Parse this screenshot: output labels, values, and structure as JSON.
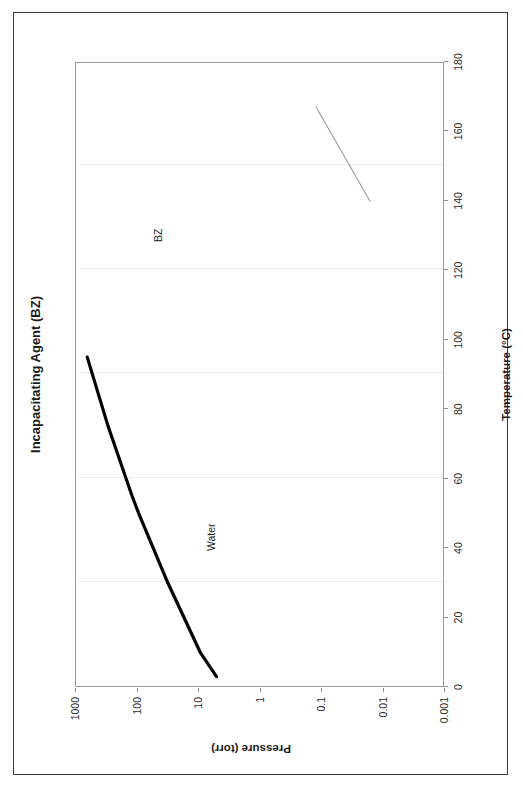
{
  "document": {
    "border_color": "#3a3a3a",
    "background": "#ffffff",
    "orientation": "landscape page scanned in portrait (chart rotated 90 degrees)"
  },
  "chart_data": {
    "type": "line",
    "title": "Incapacitating Agent (BZ)",
    "xlabel": "Temperature (°C)",
    "ylabel": "Pressure (torr)",
    "xlim": [
      0,
      180
    ],
    "xticks": [
      "0",
      "20",
      "40",
      "60",
      "80",
      "100",
      "120",
      "140",
      "160",
      "180"
    ],
    "xtick_values": [
      0,
      20,
      40,
      60,
      80,
      100,
      120,
      140,
      160,
      180
    ],
    "yscale": "log",
    "ylim": [
      0.001,
      1000
    ],
    "yticks": [
      "1000",
      "100",
      "10",
      "1",
      "0.1",
      "0.01",
      "0.001"
    ],
    "ytick_values": [
      1000,
      100,
      10,
      1,
      0.1,
      0.01,
      0.001
    ],
    "grid": "vertical dotted gridlines at each decade of pressure",
    "legend": "inline series labels",
    "series": [
      {
        "name": "Water",
        "label": "Water",
        "color": "#000000",
        "linewidth": 3.2,
        "points": [
          {
            "x": 3,
            "y": 5
          },
          {
            "x": 10,
            "y": 9.2
          },
          {
            "x": 30,
            "y": 31
          },
          {
            "x": 50,
            "y": 92
          },
          {
            "x": 55,
            "y": 118
          },
          {
            "x": 75,
            "y": 289
          },
          {
            "x": 95,
            "y": 634
          }
        ]
      },
      {
        "name": "BZ",
        "label": "BZ",
        "color": "#9a9a9a",
        "linewidth": 1.1,
        "points": [
          {
            "x": 140,
            "y": 0.016
          },
          {
            "x": 167,
            "y": 0.12
          }
        ]
      }
    ],
    "annotations": [
      {
        "text": "Water",
        "x": 68,
        "y": 60
      },
      {
        "text": "BZ",
        "x": 150,
        "y": 0.055
      }
    ]
  }
}
